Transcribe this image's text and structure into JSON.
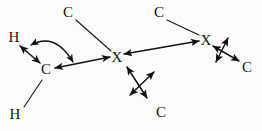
{
  "figure": {
    "background_color": "#fdfdfb",
    "ink_color": "#111111",
    "width": 262,
    "height": 131,
    "atoms": [
      {
        "id": "h-top",
        "label": "H",
        "x": 14,
        "y": 38
      },
      {
        "id": "h-bottom",
        "label": "H",
        "x": 15,
        "y": 115
      },
      {
        "id": "c-left",
        "label": "C",
        "x": 46,
        "y": 70
      },
      {
        "id": "c-top-left",
        "label": "C",
        "x": 68,
        "y": 13
      },
      {
        "id": "x-center",
        "label": "X",
        "x": 117,
        "y": 58
      },
      {
        "id": "c-top-right",
        "label": "C",
        "x": 159,
        "y": 13
      },
      {
        "id": "x-right",
        "label": "X",
        "x": 206,
        "y": 41
      },
      {
        "id": "c-bottom",
        "label": "C",
        "x": 161,
        "y": 113
      },
      {
        "id": "c-right",
        "label": "C",
        "x": 247,
        "y": 68
      }
    ],
    "bonds": [
      {
        "id": "bond-h-bottom-c-left",
        "from": "h-bottom",
        "to": "c-left"
      },
      {
        "id": "bond-c-top-left-x",
        "from": "c-top-left",
        "to": "x-center"
      },
      {
        "id": "bond-c-top-right-x",
        "from": "c-top-right",
        "to": "x-right"
      }
    ],
    "double_arrows": [
      {
        "id": "arrow-h-c",
        "label": "H to C stretch"
      },
      {
        "id": "arrow-c-x",
        "label": "C to X stretch"
      },
      {
        "id": "arrow-x-x",
        "label": "X to X stretch"
      },
      {
        "id": "arrow-center-v",
        "label": "center vertical displacement"
      },
      {
        "id": "arrow-center-d",
        "label": "center diagonal displacement"
      },
      {
        "id": "arrow-right-v",
        "label": "right vertical displacement"
      },
      {
        "id": "arrow-right-d",
        "label": "right diagonal displacement"
      }
    ],
    "curved_arrows": [
      {
        "id": "arrow-bend-hcx",
        "label": "H-C-X bend"
      }
    ]
  }
}
